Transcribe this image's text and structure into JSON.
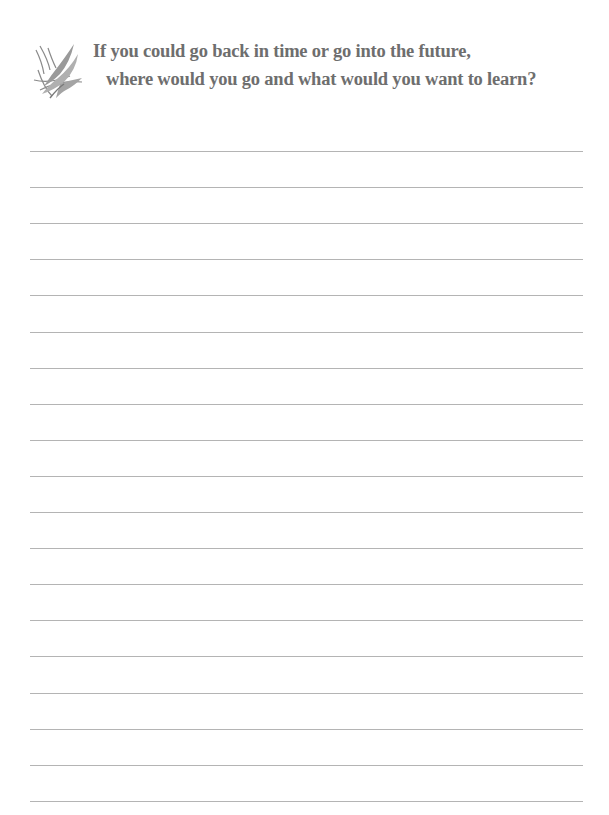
{
  "prompt": {
    "ornament_icon": "leaf-quill-flourish-icon",
    "line1": "If you could go back in time or go into the future,",
    "line2": "where would you go and what would you want to learn?"
  },
  "colors": {
    "text": "#6e6e6e",
    "rule": "#b4b4b4",
    "background": "#ffffff"
  },
  "writing_area": {
    "rule_count": 19,
    "first_rule_y": 151,
    "rule_spacing": 36.1
  }
}
